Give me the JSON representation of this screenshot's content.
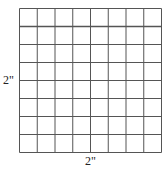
{
  "diagram": {
    "type": "grid-square",
    "rows": 8,
    "columns": 8,
    "line_color": "#555555",
    "background": "#ffffff",
    "grid": {
      "left": 19.5,
      "top": 8.5,
      "width": 142,
      "height": 144
    },
    "emphasized_horizontal_line_index": 1
  },
  "labels": {
    "side": "2\"",
    "bottom": "2\""
  }
}
